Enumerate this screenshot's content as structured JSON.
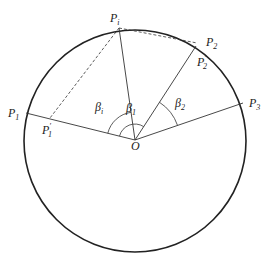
{
  "diagram": {
    "type": "geometry",
    "circle": {
      "cx": 135,
      "cy": 141,
      "r": 111,
      "stroke": "#222222"
    },
    "center": {
      "name": "O",
      "x": 135,
      "y": 140,
      "label": "O"
    },
    "points": [
      {
        "id": "Pi",
        "label": "P",
        "sub": "i",
        "prime": "",
        "x": 119,
        "y": 28,
        "lx": 110,
        "ly": 22
      },
      {
        "id": "P2",
        "label": "P",
        "sub": "2",
        "prime": "",
        "x": 197,
        "y": 43,
        "lx": 206,
        "ly": 46
      },
      {
        "id": "P2p",
        "label": "P",
        "sub": "2",
        "prime": "′",
        "x": 194,
        "y": 49,
        "lx": 197,
        "ly": 66
      },
      {
        "id": "P3",
        "label": "P",
        "sub": "3",
        "prime": "",
        "x": 243,
        "y": 103,
        "lx": 249,
        "ly": 107
      },
      {
        "id": "P1",
        "label": "P",
        "sub": "1",
        "prime": "",
        "x": 26,
        "y": 113,
        "lx": 8,
        "ly": 117
      },
      {
        "id": "P1p",
        "label": "P",
        "sub": "1",
        "prime": "′",
        "x": 50,
        "y": 118,
        "lx": 42,
        "ly": 134
      }
    ],
    "solid_lines": [
      [
        "O",
        "Pi"
      ],
      [
        "O",
        "P2p"
      ],
      [
        "O",
        "P3"
      ],
      [
        "O",
        "P1"
      ]
    ],
    "dashed_lines": [
      [
        "Pi",
        "P1p"
      ],
      [
        "Pi",
        "P2"
      ]
    ],
    "angles": [
      {
        "label": "β",
        "sub": "i",
        "lx": 95,
        "ly": 111,
        "desc": "between OP1 and OPi"
      },
      {
        "label": "β",
        "sub": "1",
        "lx": 128,
        "ly": 111,
        "desc": "inner arc"
      },
      {
        "label": "β",
        "sub": "2",
        "lx": 176,
        "ly": 107,
        "desc": "between OP2 and OP3"
      }
    ]
  }
}
